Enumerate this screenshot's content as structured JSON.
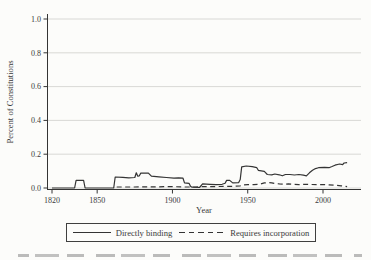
{
  "colors": {
    "line": "#343434",
    "grid": "#cfcfcb",
    "text": "#3a3a3a",
    "background": "#fcfcfa"
  },
  "chart_data": {
    "type": "line",
    "title": "",
    "xlabel": "Year",
    "ylabel": "Percent of Constitutions",
    "xlim": [
      1817,
      2020
    ],
    "ylim": [
      0,
      1.0
    ],
    "x_ticks": [
      1820,
      1850,
      1900,
      1950,
      2000
    ],
    "y_ticks": [
      0.0,
      0.2,
      0.4,
      0.6,
      0.8,
      1.0
    ],
    "grid": "horizontal-light",
    "legend_position": "bottom-boxed",
    "series": [
      {
        "name": "Directly binding",
        "line_style": "solid",
        "points": [
          [
            1820,
            0
          ],
          [
            1835,
            0
          ],
          [
            1836,
            0.045
          ],
          [
            1841,
            0.045
          ],
          [
            1842,
            0
          ],
          [
            1861,
            0
          ],
          [
            1862,
            0.065
          ],
          [
            1867,
            0.063
          ],
          [
            1871,
            0.06
          ],
          [
            1875,
            0.062
          ],
          [
            1876,
            0.09
          ],
          [
            1877,
            0.07
          ],
          [
            1878,
            0.072
          ],
          [
            1879,
            0.088
          ],
          [
            1884,
            0.088
          ],
          [
            1886,
            0.07
          ],
          [
            1891,
            0.066
          ],
          [
            1896,
            0.062
          ],
          [
            1901,
            0.058
          ],
          [
            1904,
            0.06
          ],
          [
            1907,
            0.058
          ],
          [
            1908,
            0.03
          ],
          [
            1911,
            0.028
          ],
          [
            1912,
            0.01
          ],
          [
            1913,
            0.005
          ],
          [
            1918,
            0.003
          ],
          [
            1920,
            0.025
          ],
          [
            1925,
            0.022
          ],
          [
            1929,
            0.02
          ],
          [
            1933,
            0.022
          ],
          [
            1935,
            0.028
          ],
          [
            1936,
            0.045
          ],
          [
            1938,
            0.045
          ],
          [
            1940,
            0.03
          ],
          [
            1944,
            0.032
          ],
          [
            1945,
            0.05
          ],
          [
            1946,
            0.125
          ],
          [
            1949,
            0.13
          ],
          [
            1953,
            0.126
          ],
          [
            1956,
            0.12
          ],
          [
            1957,
            0.105
          ],
          [
            1961,
            0.098
          ],
          [
            1963,
            0.08
          ],
          [
            1966,
            0.078
          ],
          [
            1968,
            0.083
          ],
          [
            1971,
            0.078
          ],
          [
            1973,
            0.072
          ],
          [
            1975,
            0.08
          ],
          [
            1978,
            0.08
          ],
          [
            1981,
            0.077
          ],
          [
            1984,
            0.08
          ],
          [
            1987,
            0.076
          ],
          [
            1989,
            0.072
          ],
          [
            1991,
            0.09
          ],
          [
            1993,
            0.105
          ],
          [
            1995,
            0.115
          ],
          [
            1997,
            0.12
          ],
          [
            2001,
            0.122
          ],
          [
            2004,
            0.12
          ],
          [
            2006,
            0.127
          ],
          [
            2008,
            0.135
          ],
          [
            2011,
            0.142
          ],
          [
            2013,
            0.138
          ],
          [
            2014,
            0.148
          ],
          [
            2016,
            0.15
          ]
        ]
      },
      {
        "name": "Requires incorporation",
        "line_style": "dashed",
        "points": [
          [
            1863,
            0.006
          ],
          [
            1875,
            0.006
          ],
          [
            1890,
            0.007
          ],
          [
            1900,
            0.008
          ],
          [
            1908,
            0.006
          ],
          [
            1915,
            0.006
          ],
          [
            1920,
            0.008
          ],
          [
            1928,
            0.008
          ],
          [
            1935,
            0.01
          ],
          [
            1941,
            0.01
          ],
          [
            1945,
            0.013
          ],
          [
            1947,
            0.018
          ],
          [
            1950,
            0.02
          ],
          [
            1954,
            0.02
          ],
          [
            1958,
            0.022
          ],
          [
            1961,
            0.03
          ],
          [
            1964,
            0.032
          ],
          [
            1966,
            0.03
          ],
          [
            1968,
            0.027
          ],
          [
            1971,
            0.024
          ],
          [
            1974,
            0.022
          ],
          [
            1977,
            0.025
          ],
          [
            1980,
            0.022
          ],
          [
            1984,
            0.02
          ],
          [
            1988,
            0.022
          ],
          [
            1992,
            0.021
          ],
          [
            1996,
            0.02
          ],
          [
            2000,
            0.021
          ],
          [
            2004,
            0.019
          ],
          [
            2008,
            0.016
          ],
          [
            2012,
            0.013
          ],
          [
            2014,
            0.012
          ],
          [
            2016,
            0.008
          ]
        ]
      }
    ]
  }
}
